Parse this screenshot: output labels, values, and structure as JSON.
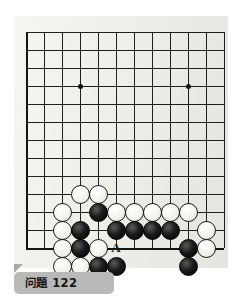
{
  "page": {
    "background": "#ffffff",
    "paper_color": "#f1f0ea"
  },
  "caption": {
    "text": "问題 122",
    "label_number": "122",
    "label_prefix": "问題",
    "background": "#b9b9b7",
    "text_color": "#17161a"
  },
  "board": {
    "type": "go-board-diagram",
    "description": "Partial go board showing the bottom-left corner and lower side",
    "line_color": "#201f1d",
    "edge_color": "#15140f",
    "grid_spacing": 18,
    "origin_x": 26,
    "origin_y": 32,
    "columns": 12,
    "rows": 13,
    "left_edge_column": 0,
    "bottom_edge_row": 12,
    "top_cut_off": true,
    "right_cut_off": true,
    "hoshi": [
      {
        "col": 3,
        "row": 3
      },
      {
        "col": 9,
        "row": 3
      }
    ],
    "black_color": "#000000",
    "white_color": "#f4f3ee"
  },
  "stones": [
    {
      "color": "white",
      "col": 3,
      "row": 9
    },
    {
      "color": "white",
      "col": 4,
      "row": 9
    },
    {
      "color": "white",
      "col": 2,
      "row": 10
    },
    {
      "color": "black",
      "col": 4,
      "row": 10
    },
    {
      "color": "white",
      "col": 5,
      "row": 10
    },
    {
      "color": "white",
      "col": 6,
      "row": 10
    },
    {
      "color": "white",
      "col": 7,
      "row": 10
    },
    {
      "color": "white",
      "col": 8,
      "row": 10
    },
    {
      "color": "white",
      "col": 9,
      "row": 10
    },
    {
      "color": "white",
      "col": 2,
      "row": 11
    },
    {
      "color": "black",
      "col": 3,
      "row": 11
    },
    {
      "color": "black",
      "col": 5,
      "row": 11
    },
    {
      "color": "black",
      "col": 6,
      "row": 11
    },
    {
      "color": "black",
      "col": 7,
      "row": 11
    },
    {
      "color": "black",
      "col": 8,
      "row": 11
    },
    {
      "color": "white",
      "col": 10,
      "row": 11
    },
    {
      "color": "white",
      "col": 2,
      "row": 12
    },
    {
      "color": "black",
      "col": 3,
      "row": 12
    },
    {
      "color": "white",
      "col": 4,
      "row": 12
    },
    {
      "color": "black",
      "col": 9,
      "row": 12
    },
    {
      "color": "white",
      "col": 10,
      "row": 12
    },
    {
      "color": "white",
      "col": 2,
      "row": 13
    },
    {
      "color": "white",
      "col": 3,
      "row": 13
    },
    {
      "color": "black",
      "col": 4,
      "row": 13
    },
    {
      "color": "black",
      "col": 5,
      "row": 13
    },
    {
      "color": "black",
      "col": 9,
      "row": 13
    }
  ],
  "markers": [
    {
      "label": "A",
      "col": 5,
      "row": 12
    }
  ]
}
